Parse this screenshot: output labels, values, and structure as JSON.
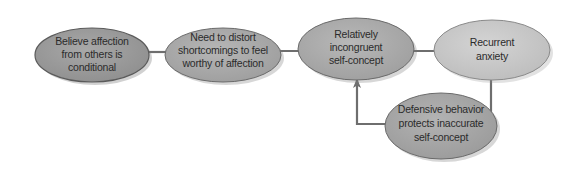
{
  "diagram": {
    "type": "flowchart",
    "nodes": [
      {
        "id": "n1",
        "lines": [
          "Believe affection",
          "from others is",
          "conditional"
        ],
        "fill": "#9a9a9a"
      },
      {
        "id": "n2",
        "lines": [
          "Need to distort",
          "shortcomings to feel",
          "worthy of affection"
        ],
        "fill": "#a9a9a9"
      },
      {
        "id": "n3",
        "lines": [
          "Relatively",
          "incongruent",
          "self-concept"
        ],
        "fill": "#aaaaaa"
      },
      {
        "id": "n4",
        "lines": [
          "Recurrent",
          "anxiety"
        ],
        "fill": "#c8c8c8"
      },
      {
        "id": "n5",
        "lines": [
          "Defensive behavior",
          "protects inaccurate",
          "self-concept"
        ],
        "fill": "#a6a6a6"
      }
    ],
    "edges": [
      {
        "from": "n1",
        "to": "n2"
      },
      {
        "from": "n2",
        "to": "n3"
      },
      {
        "from": "n3",
        "to": "n4"
      },
      {
        "from": "n4",
        "to": "n5"
      },
      {
        "from": "n5",
        "to": "n3"
      }
    ],
    "colors": {
      "arrow": "#6e6e6e",
      "outline": "#5a5a5a",
      "text": "#2b2b2b"
    }
  }
}
